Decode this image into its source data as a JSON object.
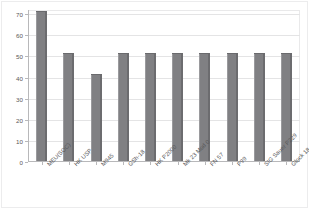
{
  "chart_data": {
    "type": "bar",
    "title": "",
    "subtitle": "",
    "xlabel": "",
    "ylabel": "",
    "categories": [
      "MEU(SOC)",
      "HK USP",
      "M945",
      "GSh-18",
      "HK P2000",
      "Mk 23 Mod 0",
      "FN 57",
      "P99",
      "SIG Sauer P229",
      "Glock 18"
    ],
    "values": [
      71,
      51,
      41,
      51,
      51,
      51,
      51,
      51,
      51,
      51
    ],
    "ylim": [
      0,
      72
    ],
    "yticks": [
      0,
      10,
      20,
      30,
      40,
      50,
      60,
      70
    ],
    "ytick_labels": [
      "0",
      "10",
      "20",
      "30",
      "40",
      "50",
      "60",
      "70"
    ],
    "grid": true,
    "grid_axis": "y",
    "legend": false,
    "legend_position": "none",
    "bar_color": "#808083",
    "bar_edge_color": "#6c6c6f",
    "grid_color": "#e4e4e5",
    "axis_color": "#b8b8ba",
    "background_color": "#ffffff",
    "tick_label_color": "#58585a"
  }
}
